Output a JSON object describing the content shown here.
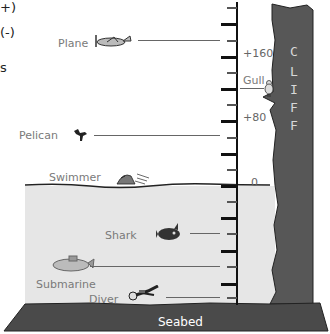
{
  "cropped_text": {
    "line1": "+)",
    "line2": "(-)",
    "line3": "s"
  },
  "scale": {
    "labels": [
      {
        "text": "+160",
        "value": 160
      },
      {
        "text": "+80",
        "value": 80
      },
      {
        "text": "0",
        "value": 0
      }
    ],
    "tick_interval": 20,
    "unit_note": "sea level = 0"
  },
  "objects": [
    {
      "id": "plane",
      "label": "Plane",
      "icon": "airplane-icon",
      "position": "above sea level (~+180)"
    },
    {
      "id": "gull",
      "label": "Gull",
      "icon": "seagull-icon",
      "position": "on cliff ledge (~+120)"
    },
    {
      "id": "pelican",
      "label": "Pelican",
      "icon": "pelican-icon",
      "position": "above sea level (~+60)"
    },
    {
      "id": "swimmer",
      "label": "Swimmer",
      "icon": "swimmer-icon",
      "position": "at sea level (0)"
    },
    {
      "id": "shark",
      "label": "Shark",
      "icon": "shark-icon",
      "position": "below sea level (~-60)"
    },
    {
      "id": "submarine",
      "label": "Submarine",
      "icon": "submarine-icon",
      "position": "below sea level (~-100)"
    },
    {
      "id": "diver",
      "label": "Diver",
      "icon": "diver-icon",
      "position": "below sea level (~-140)"
    }
  ],
  "cliff": {
    "letters": [
      "C",
      "L",
      "I",
      "F",
      "F"
    ],
    "color": "#575757"
  },
  "seabed": {
    "label": "Seabed",
    "color": "#4a4a4a"
  },
  "colors": {
    "water": "#e6e6e6",
    "axis": "#111111",
    "label_text": "#7a7a7a"
  }
}
